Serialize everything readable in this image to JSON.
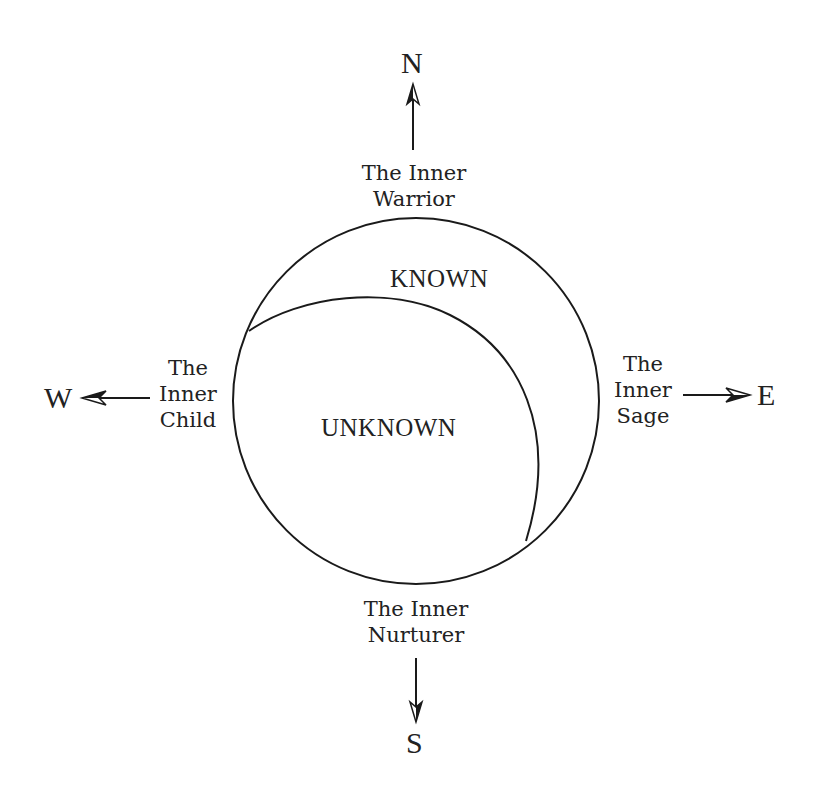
{
  "diagram": {
    "directions": {
      "north": "N",
      "south": "S",
      "east": "E",
      "west": "W"
    },
    "archetypes": {
      "north": [
        "The Inner",
        "Warrior"
      ],
      "south": [
        "The Inner",
        "Nurturer"
      ],
      "east": [
        "The",
        "Inner",
        "Sage"
      ],
      "west": [
        "The",
        "Inner",
        "Child"
      ]
    },
    "regions": {
      "known": "KNOWN",
      "unknown": "UNKNOWN"
    },
    "colors": {
      "line": "#1a1a1a",
      "background": "#ffffff"
    }
  }
}
